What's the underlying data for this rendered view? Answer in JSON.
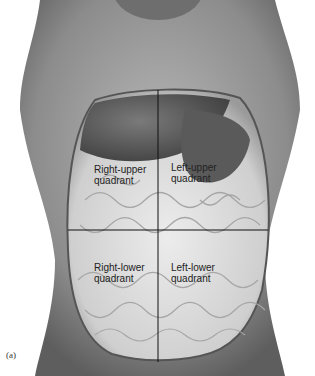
{
  "figure": {
    "panel_label": "(a)",
    "quadrants": {
      "right_upper": {
        "line1": "Right-upper",
        "line2": "quadrant"
      },
      "left_upper": {
        "line1": "Left-upper",
        "line2": "quadrant"
      },
      "right_lower": {
        "line1": "Right-lower",
        "line2": "quadrant"
      },
      "left_lower": {
        "line1": "Left-lower",
        "line2": "quadrant"
      }
    }
  }
}
